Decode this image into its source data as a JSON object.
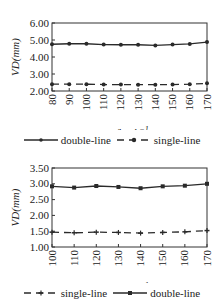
{
  "chart_data": [
    {
      "type": "line",
      "title": "",
      "xlabel": "v/km.h^-1",
      "ylabel": "VD(mm)",
      "x": [
        80,
        90,
        100,
        110,
        120,
        130,
        140,
        150,
        160,
        170
      ],
      "x_tick_labels": [
        "80",
        "90",
        "100",
        "110",
        "120",
        "130",
        "140",
        "150",
        "160",
        "170"
      ],
      "y_tick_labels": [
        "6.00",
        "5.00",
        "4.00",
        "3.00",
        "2.00"
      ],
      "ylim": [
        2.0,
        6.0
      ],
      "xlim": [
        80,
        170
      ],
      "grid": false,
      "legend_position": "bottom",
      "series": [
        {
          "name": "double-line",
          "style": "solid",
          "marker": "dot",
          "values": [
            4.75,
            4.78,
            4.78,
            4.73,
            4.72,
            4.72,
            4.68,
            4.73,
            4.77,
            4.88
          ]
        },
        {
          "name": "single-line",
          "style": "dashed",
          "marker": "dot",
          "values": [
            2.4,
            2.4,
            2.4,
            2.38,
            2.38,
            2.37,
            2.37,
            2.38,
            2.4,
            2.45
          ]
        }
      ],
      "legend": [
        "double-line",
        "single-line"
      ]
    },
    {
      "type": "line",
      "title": "",
      "xlabel": "v/km.h^-1",
      "ylabel": "VD(mm)",
      "x": [
        100,
        110,
        120,
        130,
        140,
        150,
        160,
        170
      ],
      "x_tick_labels": [
        "100",
        "110",
        "120",
        "130",
        "140",
        "150",
        "160",
        "170"
      ],
      "y_tick_labels": [
        "3.50",
        "3.00",
        "2.50",
        "2.00",
        "1.50",
        "1.00"
      ],
      "ylim": [
        1.0,
        3.5
      ],
      "xlim": [
        100,
        170
      ],
      "grid": false,
      "legend_position": "bottom",
      "series": [
        {
          "name": "single-line",
          "style": "dashed",
          "marker": "plus",
          "values": [
            1.47,
            1.45,
            1.47,
            1.46,
            1.44,
            1.46,
            1.48,
            1.52
          ]
        },
        {
          "name": "double-line",
          "style": "solid",
          "marker": "square",
          "values": [
            2.92,
            2.88,
            2.93,
            2.9,
            2.86,
            2.92,
            2.94,
            3.0
          ]
        }
      ],
      "legend": [
        "single-line",
        "double-line"
      ]
    }
  ],
  "charts": {
    "top": {
      "ylabel": "VD(mm)",
      "xlabel_main": "v/km.h",
      "xlabel_sup": "−1",
      "legend": [
        {
          "label": "double-line"
        },
        {
          "label": "single-line"
        }
      ]
    },
    "bottom": {
      "ylabel": "VD(mm)",
      "xlabel_main": "v/km.h",
      "xlabel_sup": "−1",
      "legend": [
        {
          "label": "single-line"
        },
        {
          "label": "double-line"
        }
      ]
    }
  },
  "colors": {
    "line": "#2a2a2a",
    "axis": "#333333"
  }
}
